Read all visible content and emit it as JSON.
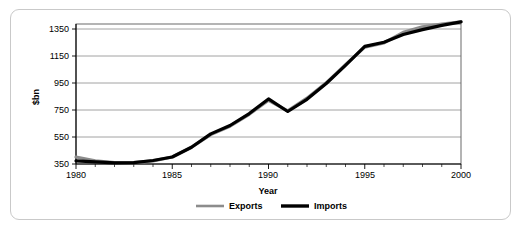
{
  "chart_data": {
    "type": "line",
    "title": "",
    "xlabel": "Year",
    "ylabel": "$bn",
    "xlim": [
      1980,
      2000
    ],
    "ylim": [
      350,
      1350
    ],
    "xticks": [
      1980,
      1985,
      1990,
      1995,
      2000
    ],
    "xtick_labels": [
      "1980",
      "1985",
      "1990",
      "1995",
      "2000"
    ],
    "yticks": [
      350,
      550,
      750,
      950,
      1150,
      1350
    ],
    "ytick_labels": [
      "350",
      "550",
      "750",
      "950",
      "1150",
      "1350"
    ],
    "grid": "horizontal",
    "legend_position": "bottom-center",
    "x": [
      1980,
      1981,
      1982,
      1983,
      1984,
      1985,
      1986,
      1987,
      1988,
      1989,
      1990,
      1991,
      1992,
      1993,
      1994,
      1995,
      1996,
      1997,
      1998,
      1999,
      2000
    ],
    "series": [
      {
        "name": "Exports",
        "color": "#8c8c8c",
        "width": 3.2,
        "values": [
          400,
          372,
          360,
          360,
          372,
          400,
          470,
          560,
          620,
          705,
          805,
          730,
          820,
          930,
          1060,
          1185,
          1215,
          1290,
          1330,
          1350,
          1365
        ]
      },
      {
        "name": "Imports",
        "color": "#000000",
        "width": 3.2,
        "values": [
          372,
          365,
          358,
          360,
          375,
          400,
          470,
          565,
          625,
          710,
          815,
          725,
          812,
          925,
          1055,
          1190,
          1220,
          1275,
          1310,
          1340,
          1365
        ]
      }
    ]
  },
  "legend": {
    "items": [
      {
        "label": "Exports",
        "color": "#8c8c8c"
      },
      {
        "label": "Imports",
        "color": "#000000"
      }
    ]
  },
  "axes": {
    "y_title": "$bn",
    "x_title": "Year"
  }
}
